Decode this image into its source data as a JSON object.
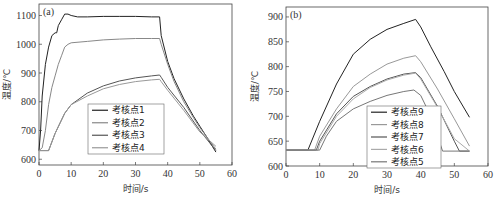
{
  "chart_data": [
    {
      "type": "line",
      "panel_label": "(a)",
      "xlabel": "时间/s",
      "ylabel": "温度/℃",
      "xlim": [
        0,
        60
      ],
      "ylim": [
        580,
        1140
      ],
      "xticks": [
        0,
        10,
        20,
        30,
        40,
        50,
        60
      ],
      "yticks": [
        600,
        700,
        800,
        900,
        1000,
        1100
      ],
      "grid": false,
      "legend_position": "lower-center",
      "series": [
        {
          "name": "考核点1",
          "color": "#222222",
          "x": [
            0,
            0.5,
            1,
            2,
            3,
            4,
            5,
            5.5,
            6,
            7,
            8,
            9,
            10,
            12,
            15,
            20,
            25,
            30,
            35,
            37.5,
            38,
            40,
            42,
            45,
            48,
            50,
            52,
            55
          ],
          "y": [
            630,
            700,
            820,
            930,
            990,
            1030,
            1040,
            1040,
            1065,
            1085,
            1105,
            1105,
            1100,
            1095,
            1095,
            1097,
            1097,
            1097,
            1095,
            1095,
            1030,
            940,
            880,
            810,
            750,
            715,
            680,
            625
          ]
        },
        {
          "name": "考核点2",
          "color": "#888888",
          "x": [
            0,
            1,
            2,
            3,
            4,
            5,
            6,
            7,
            8,
            9,
            10,
            15,
            20,
            25,
            30,
            35,
            37.5,
            38,
            40,
            42,
            45,
            48,
            50,
            52,
            55
          ],
          "y": [
            630,
            640,
            700,
            790,
            850,
            890,
            930,
            960,
            990,
            1000,
            1005,
            1010,
            1015,
            1018,
            1020,
            1020,
            1020,
            1000,
            930,
            870,
            800,
            745,
            710,
            680,
            635
          ]
        },
        {
          "name": "考核点3",
          "color": "#555555",
          "x": [
            0,
            1,
            3,
            5,
            8,
            10,
            15,
            20,
            25,
            30,
            35,
            37.5,
            38,
            40,
            45,
            50,
            55
          ],
          "y": [
            630,
            630,
            630,
            690,
            760,
            790,
            830,
            855,
            872,
            883,
            890,
            893,
            885,
            850,
            780,
            700,
            630
          ]
        },
        {
          "name": "考核点4",
          "color": "#999999",
          "x": [
            0,
            1,
            3,
            5,
            8,
            10,
            15,
            20,
            25,
            30,
            35,
            37.5,
            38,
            40,
            45,
            50,
            55
          ],
          "y": [
            630,
            630,
            630,
            690,
            760,
            790,
            820,
            845,
            860,
            870,
            876,
            878,
            870,
            840,
            770,
            695,
            645
          ]
        }
      ]
    },
    {
      "type": "line",
      "panel_label": "(b)",
      "xlabel": "时间/s",
      "ylabel": "温度/℃",
      "xlim": [
        0,
        60
      ],
      "ylim": [
        600,
        920
      ],
      "xticks": [
        0,
        10,
        20,
        30,
        40,
        50,
        60
      ],
      "yticks": [
        600,
        650,
        700,
        750,
        800,
        850,
        900
      ],
      "grid": false,
      "legend_position": "lower-center",
      "series": [
        {
          "name": "考核点9",
          "color": "#222222",
          "x": [
            0,
            6.5,
            10,
            15,
            20,
            25,
            30,
            35,
            38.5,
            40,
            43,
            47,
            50,
            54.5
          ],
          "y": [
            632,
            632,
            690,
            765,
            825,
            855,
            875,
            887,
            895,
            880,
            840,
            790,
            750,
            698
          ]
        },
        {
          "name": "考核点8",
          "color": "#999999",
          "x": [
            0,
            8.5,
            10,
            15,
            20,
            25,
            30,
            35,
            38.5,
            40,
            45,
            50,
            54.5
          ],
          "y": [
            632,
            632,
            660,
            715,
            760,
            785,
            805,
            817,
            822,
            810,
            755,
            695,
            640
          ]
        },
        {
          "name": "考核点7",
          "color": "#555555",
          "x": [
            0,
            9,
            10,
            15,
            20,
            25,
            30,
            35,
            38.5,
            40,
            45,
            50,
            51.5,
            54.5
          ],
          "y": [
            632,
            632,
            650,
            705,
            740,
            760,
            775,
            785,
            788,
            778,
            720,
            650,
            630,
            630
          ]
        },
        {
          "name": "考核点6",
          "color": "#aaaaaa",
          "x": [
            0,
            9.5,
            10,
            15,
            20,
            25,
            30,
            35,
            38.5,
            40,
            45,
            50,
            54.5
          ],
          "y": [
            632,
            632,
            645,
            700,
            735,
            758,
            773,
            783,
            787,
            775,
            718,
            655,
            630
          ]
        },
        {
          "name": "考核点5",
          "color": "#777777",
          "x": [
            0,
            10,
            12,
            15,
            20,
            25,
            30,
            35,
            38,
            40,
            43,
            46.5,
            54.5
          ],
          "y": [
            632,
            632,
            660,
            690,
            715,
            730,
            742,
            750,
            753,
            742,
            700,
            630,
            630
          ]
        }
      ]
    }
  ]
}
